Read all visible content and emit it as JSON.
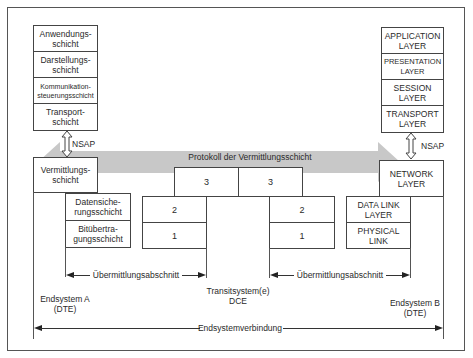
{
  "left_system": {
    "upper_layers": [
      {
        "label": "Anwendungs-\nschicht"
      },
      {
        "label": "Darstellungs-\nschicht"
      },
      {
        "label": "Kommunikation-\nsteuerungsschicht"
      },
      {
        "label": "Transport-\nschicht"
      }
    ],
    "nsap_label": "NSAP",
    "network_layer": "Vermittlungs-\nschicht",
    "data_link_layer": "Datensiche-\nrungsschicht",
    "physical_layer": "Bitübertra-\ngungsschicht",
    "caption": "Endsystem  A\n(DTE)"
  },
  "right_system": {
    "upper_layers": [
      {
        "label": "APPLICATION\nLAYER"
      },
      {
        "label": "PRESENTATION\nLAYER"
      },
      {
        "label": "SESSION\nLAYER"
      },
      {
        "label": "TRANSPORT\nLAYER"
      }
    ],
    "nsap_label": "NSAP",
    "network_layer": "NETWORK\nLAYER",
    "data_link_layer": "DATA  LINK\nLAYER",
    "physical_layer": "PHYSICAL\nLINK",
    "caption": "Endsystem  B\n(DTE)"
  },
  "transit_system": {
    "network_boxes": [
      "3",
      "3"
    ],
    "left_stack": [
      "2",
      "1"
    ],
    "right_stack": [
      "2",
      "1"
    ],
    "caption": "Transitsystem(e)\nDCE"
  },
  "protocol_arrow": {
    "label": "Protokoll der Vermittlungsschicht",
    "color": "#c8c8c8"
  },
  "spans": {
    "left_section": "Übermittlungsabschnitt",
    "right_section": "Übermittlungsabschnitt",
    "end_to_end": "Endsystemverbindung"
  }
}
